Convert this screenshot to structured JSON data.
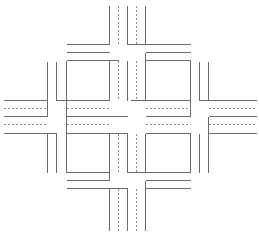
{
  "diagram": {
    "type": "road-intersection-layout",
    "colors": {
      "background": "#ffffff",
      "road_edge": "#6b6b6b",
      "lane_marking": "#8a8a8a"
    },
    "solid_lines": [
      {
        "name": "north-road-left-edge",
        "x1": 109,
        "y1": 5,
        "x2": 109,
        "y2": 44
      },
      {
        "name": "north-road-median-left",
        "x1": 127,
        "y1": 5,
        "x2": 127,
        "y2": 44
      },
      {
        "name": "north-road-median-right",
        "x1": 145,
        "y1": 5,
        "x2": 145,
        "y2": 44
      },
      {
        "name": "north-top-left-hline",
        "x1": 66,
        "y1": 44,
        "x2": 109,
        "y2": 44
      },
      {
        "name": "north-top-left-hline-2",
        "x1": 66,
        "y1": 52,
        "x2": 109,
        "y2": 52
      },
      {
        "name": "north-top-right-hline",
        "x1": 127,
        "y1": 44,
        "x2": 190,
        "y2": 44
      },
      {
        "name": "north-top-right-hline-2",
        "x1": 145,
        "y1": 52,
        "x2": 190,
        "y2": 52
      },
      {
        "name": "north-right-stub",
        "x1": 145,
        "y1": 52,
        "x2": 145,
        "y2": 60
      },
      {
        "name": "nw-block-top",
        "x1": 66,
        "y1": 60,
        "x2": 109,
        "y2": 60
      },
      {
        "name": "nw-block-left",
        "x1": 66,
        "y1": 60,
        "x2": 66,
        "y2": 100
      },
      {
        "name": "nw-block-right",
        "x1": 109,
        "y1": 60,
        "x2": 109,
        "y2": 100
      },
      {
        "name": "nw-block-bottom",
        "x1": 66,
        "y1": 100,
        "x2": 109,
        "y2": 100
      },
      {
        "name": "nw-post-left",
        "x1": 47,
        "y1": 61,
        "x2": 47,
        "y2": 100
      },
      {
        "name": "nw-post-right",
        "x1": 56,
        "y1": 61,
        "x2": 56,
        "y2": 100
      },
      {
        "name": "nw-post-bottom",
        "x1": 56,
        "y1": 100,
        "x2": 66,
        "y2": 100
      },
      {
        "name": "nw-inner-left",
        "x1": 109,
        "y1": 60,
        "x2": 118,
        "y2": 60
      },
      {
        "name": "nw-inner-right-vline",
        "x1": 127,
        "y1": 60,
        "x2": 127,
        "y2": 100
      },
      {
        "name": "ne-block-top",
        "x1": 145,
        "y1": 60,
        "x2": 190,
        "y2": 60
      },
      {
        "name": "ne-block-left",
        "x1": 145,
        "y1": 60,
        "x2": 145,
        "y2": 100
      },
      {
        "name": "ne-block-right",
        "x1": 190,
        "y1": 60,
        "x2": 190,
        "y2": 100
      },
      {
        "name": "ne-block-bottom",
        "x1": 130,
        "y1": 100,
        "x2": 190,
        "y2": 100
      },
      {
        "name": "ne-post-left",
        "x1": 199,
        "y1": 61,
        "x2": 199,
        "y2": 100
      },
      {
        "name": "ne-post-right",
        "x1": 208,
        "y1": 61,
        "x2": 208,
        "y2": 100
      },
      {
        "name": "ne-post-bottom",
        "x1": 199,
        "y1": 100,
        "x2": 208,
        "y2": 100
      },
      {
        "name": "west-road-top-edge",
        "x1": 3,
        "y1": 100,
        "x2": 47,
        "y2": 100
      },
      {
        "name": "west-road-mid-edge",
        "x1": 3,
        "y1": 116,
        "x2": 47,
        "y2": 116
      },
      {
        "name": "west-road-bottom-edge",
        "x1": 3,
        "y1": 133,
        "x2": 56,
        "y2": 133
      },
      {
        "name": "west-road-top-vline",
        "x1": 47,
        "y1": 61,
        "x2": 47,
        "y2": 116
      },
      {
        "name": "east-road-top-edge",
        "x1": 208,
        "y1": 100,
        "x2": 256,
        "y2": 100
      },
      {
        "name": "east-road-mid-edge",
        "x1": 208,
        "y1": 116,
        "x2": 256,
        "y2": 116
      },
      {
        "name": "east-road-bottom-edge",
        "x1": 208,
        "y1": 133,
        "x2": 256,
        "y2": 133
      },
      {
        "name": "east-road-mid-vline",
        "x1": 208,
        "y1": 116,
        "x2": 208,
        "y2": 172
      },
      {
        "name": "center-left-vline-upper",
        "x1": 66,
        "y1": 116,
        "x2": 66,
        "y2": 100
      },
      {
        "name": "center-left-hline",
        "x1": 66,
        "y1": 116,
        "x2": 127,
        "y2": 116
      },
      {
        "name": "center-right-hline",
        "x1": 145,
        "y1": 116,
        "x2": 190,
        "y2": 116
      },
      {
        "name": "center-right-vline",
        "x1": 190,
        "y1": 100,
        "x2": 190,
        "y2": 116
      },
      {
        "name": "sw-block-top",
        "x1": 66,
        "y1": 133,
        "x2": 127,
        "y2": 133
      },
      {
        "name": "sw-block-left",
        "x1": 66,
        "y1": 116,
        "x2": 66,
        "y2": 172
      },
      {
        "name": "sw-block-right",
        "x1": 109,
        "y1": 133,
        "x2": 109,
        "y2": 172
      },
      {
        "name": "sw-block-bottom",
        "x1": 66,
        "y1": 172,
        "x2": 109,
        "y2": 172
      },
      {
        "name": "sw-post-left",
        "x1": 47,
        "y1": 133,
        "x2": 47,
        "y2": 172
      },
      {
        "name": "sw-post-right",
        "x1": 56,
        "y1": 133,
        "x2": 56,
        "y2": 172
      },
      {
        "name": "sw-outer-bottom",
        "x1": 66,
        "y1": 180,
        "x2": 109,
        "y2": 180
      },
      {
        "name": "sw-outer-right",
        "x1": 109,
        "y1": 172,
        "x2": 109,
        "y2": 180
      },
      {
        "name": "se-block-top",
        "x1": 145,
        "y1": 133,
        "x2": 190,
        "y2": 133
      },
      {
        "name": "se-block-left",
        "x1": 145,
        "y1": 133,
        "x2": 145,
        "y2": 172
      },
      {
        "name": "se-block-right",
        "x1": 190,
        "y1": 133,
        "x2": 190,
        "y2": 172
      },
      {
        "name": "se-block-bottom",
        "x1": 127,
        "y1": 172,
        "x2": 190,
        "y2": 172
      },
      {
        "name": "se-post-right",
        "x1": 199,
        "y1": 133,
        "x2": 199,
        "y2": 172
      },
      {
        "name": "se-inner-left",
        "x1": 127,
        "y1": 133,
        "x2": 127,
        "y2": 172
      },
      {
        "name": "south-top-left-hline",
        "x1": 66,
        "y1": 188,
        "x2": 127,
        "y2": 188
      },
      {
        "name": "south-top-right-hline",
        "x1": 145,
        "y1": 180,
        "x2": 190,
        "y2": 180
      },
      {
        "name": "south-top-right-hline-2",
        "x1": 145,
        "y1": 188,
        "x2": 190,
        "y2": 188
      },
      {
        "name": "south-road-left-edge",
        "x1": 109,
        "y1": 188,
        "x2": 109,
        "y2": 230
      },
      {
        "name": "south-road-median-left",
        "x1": 127,
        "y1": 188,
        "x2": 127,
        "y2": 230
      },
      {
        "name": "south-road-right-edge",
        "x1": 145,
        "y1": 180,
        "x2": 145,
        "y2": 230
      }
    ],
    "dotted_lines": [
      {
        "name": "north-lane-marking-left",
        "x1": 118,
        "y1": 5,
        "x2": 118,
        "y2": 44
      },
      {
        "name": "north-lane-marking-right",
        "x1": 136,
        "y1": 5,
        "x2": 136,
        "y2": 44
      },
      {
        "name": "north-inner-lane-left",
        "x1": 118,
        "y1": 60,
        "x2": 118,
        "y2": 100
      },
      {
        "name": "north-inner-lane-right",
        "x1": 136,
        "y1": 60,
        "x2": 136,
        "y2": 100
      },
      {
        "name": "west-lane-marking-upper",
        "x1": 3,
        "y1": 108,
        "x2": 47,
        "y2": 108
      },
      {
        "name": "west-lane-marking-lower",
        "x1": 3,
        "y1": 124,
        "x2": 47,
        "y2": 124
      },
      {
        "name": "west-inner-lane-upper",
        "x1": 66,
        "y1": 108,
        "x2": 109,
        "y2": 108
      },
      {
        "name": "west-inner-lane-lower",
        "x1": 66,
        "y1": 124,
        "x2": 109,
        "y2": 124
      },
      {
        "name": "east-inner-lane-upper",
        "x1": 145,
        "y1": 108,
        "x2": 190,
        "y2": 108
      },
      {
        "name": "east-inner-lane-lower",
        "x1": 145,
        "y1": 124,
        "x2": 190,
        "y2": 124
      },
      {
        "name": "east-lane-marking-upper",
        "x1": 208,
        "y1": 108,
        "x2": 256,
        "y2": 108
      },
      {
        "name": "east-lane-marking-lower",
        "x1": 208,
        "y1": 124,
        "x2": 256,
        "y2": 124
      },
      {
        "name": "south-inner-lane-left",
        "x1": 118,
        "y1": 133,
        "x2": 118,
        "y2": 172
      },
      {
        "name": "south-inner-lane-right",
        "x1": 136,
        "y1": 133,
        "x2": 136,
        "y2": 172
      },
      {
        "name": "south-lane-marking-left",
        "x1": 118,
        "y1": 188,
        "x2": 118,
        "y2": 230
      },
      {
        "name": "south-lane-marking-right",
        "x1": 136,
        "y1": 188,
        "x2": 136,
        "y2": 230
      }
    ]
  }
}
